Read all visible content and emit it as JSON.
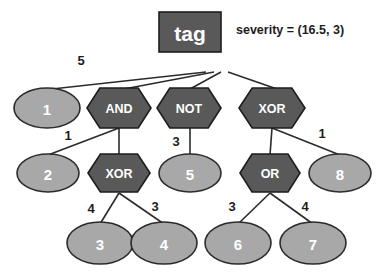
{
  "diagram": {
    "annotation": {
      "label": "severity = (16.5, 3)",
      "x": 236,
      "y": 23
    },
    "root": {
      "id": "tag",
      "label": "tag",
      "shape": "rect",
      "fill": "#595959",
      "x": 190,
      "y": 32,
      "w": 62,
      "h": 40
    },
    "nodes": [
      {
        "id": "n1",
        "label": "1",
        "shape": "ellipse",
        "style": "light",
        "x": 47,
        "y": 108,
        "rx": 33,
        "ry": 20
      },
      {
        "id": "and",
        "label": "AND",
        "shape": "hexagon",
        "style": "dark",
        "x": 119,
        "y": 108,
        "rx": 32,
        "ry": 20
      },
      {
        "id": "not",
        "label": "NOT",
        "shape": "hexagon",
        "style": "dark",
        "x": 189,
        "y": 108,
        "rx": 32,
        "ry": 20
      },
      {
        "id": "xor1",
        "label": "XOR",
        "shape": "hexagon",
        "style": "dark",
        "x": 272,
        "y": 108,
        "rx": 33,
        "ry": 20
      },
      {
        "id": "n2",
        "label": "2",
        "shape": "ellipse",
        "style": "light",
        "x": 48,
        "y": 173,
        "rx": 31,
        "ry": 19
      },
      {
        "id": "xor2",
        "label": "XOR",
        "shape": "hexagon",
        "style": "dark",
        "x": 119,
        "y": 173,
        "rx": 31,
        "ry": 19
      },
      {
        "id": "n5",
        "label": "5",
        "shape": "ellipse",
        "style": "light",
        "x": 190,
        "y": 173,
        "rx": 31,
        "ry": 19
      },
      {
        "id": "or",
        "label": "OR",
        "shape": "hexagon",
        "style": "dark",
        "x": 270,
        "y": 173,
        "rx": 30,
        "ry": 19
      },
      {
        "id": "n8",
        "label": "8",
        "shape": "ellipse",
        "style": "light",
        "x": 340,
        "y": 173,
        "rx": 31,
        "ry": 19
      },
      {
        "id": "n3",
        "label": "3",
        "shape": "ellipse",
        "style": "light",
        "x": 100,
        "y": 243,
        "rx": 33,
        "ry": 21
      },
      {
        "id": "n4",
        "label": "4",
        "shape": "ellipse",
        "style": "light",
        "x": 164,
        "y": 243,
        "rx": 33,
        "ry": 21
      },
      {
        "id": "n6",
        "label": "6",
        "shape": "ellipse",
        "style": "light",
        "x": 238,
        "y": 243,
        "rx": 33,
        "ry": 21
      },
      {
        "id": "n7",
        "label": "7",
        "shape": "ellipse",
        "style": "light",
        "x": 313,
        "y": 243,
        "rx": 33,
        "ry": 21
      }
    ],
    "edges": [
      {
        "id": "e-tag-1",
        "from": "tag",
        "to": "n1",
        "x1": 206,
        "y1": 72,
        "x2": 52,
        "y2": 89,
        "weight": "5",
        "wx": 81,
        "wy": 60
      },
      {
        "id": "e-tag-and",
        "from": "tag",
        "to": "and",
        "x1": 214,
        "y1": 72,
        "x2": 124,
        "y2": 89,
        "weight": "",
        "wx": 0,
        "wy": 0
      },
      {
        "id": "e-tag-not",
        "from": "tag",
        "to": "not",
        "x1": 221,
        "y1": 72,
        "x2": 190,
        "y2": 89,
        "weight": "",
        "wx": 0,
        "wy": 0
      },
      {
        "id": "e-tag-xor1",
        "from": "tag",
        "to": "xor1",
        "x1": 228,
        "y1": 72,
        "x2": 277,
        "y2": 89,
        "weight": "",
        "wx": 0,
        "wy": 0
      },
      {
        "id": "e-and-2",
        "from": "and",
        "to": "n2",
        "x1": 119,
        "y1": 128,
        "x2": 48,
        "y2": 155,
        "weight": "1",
        "wx": 68,
        "wy": 135
      },
      {
        "id": "e-and-xor2",
        "from": "and",
        "to": "xor2",
        "x1": 119,
        "y1": 128,
        "x2": 119,
        "y2": 155,
        "weight": "",
        "wx": 0,
        "wy": 0
      },
      {
        "id": "e-not-5",
        "from": "not",
        "to": "n5",
        "x1": 190,
        "y1": 128,
        "x2": 190,
        "y2": 155,
        "weight": "3",
        "wx": 176,
        "wy": 141
      },
      {
        "id": "e-xor1-or",
        "from": "xor1",
        "to": "or",
        "x1": 272,
        "y1": 128,
        "x2": 270,
        "y2": 155,
        "weight": "",
        "wx": 0,
        "wy": 0
      },
      {
        "id": "e-xor1-8",
        "from": "xor1",
        "to": "n8",
        "x1": 272,
        "y1": 128,
        "x2": 340,
        "y2": 155,
        "weight": "1",
        "wx": 322,
        "wy": 133
      },
      {
        "id": "e-xor2-3",
        "from": "xor2",
        "to": "n3",
        "x1": 119,
        "y1": 193,
        "x2": 100,
        "y2": 224,
        "weight": "4",
        "wx": 91,
        "wy": 208
      },
      {
        "id": "e-xor2-4",
        "from": "xor2",
        "to": "n4",
        "x1": 119,
        "y1": 193,
        "x2": 164,
        "y2": 224,
        "weight": "3",
        "wx": 155,
        "wy": 206
      },
      {
        "id": "e-or-6",
        "from": "or",
        "to": "n6",
        "x1": 270,
        "y1": 193,
        "x2": 238,
        "y2": 224,
        "weight": "3",
        "wx": 232,
        "wy": 206
      },
      {
        "id": "e-or-7",
        "from": "or",
        "to": "n7",
        "x1": 270,
        "y1": 193,
        "x2": 313,
        "y2": 224,
        "weight": "4",
        "wx": 305,
        "wy": 206
      }
    ],
    "colors": {
      "dark_fill": "#595959",
      "light_fill": "#a8a8a8",
      "stroke": "#2b2b2b",
      "label_text": "#ffffff",
      "background": "#ffffff"
    }
  }
}
